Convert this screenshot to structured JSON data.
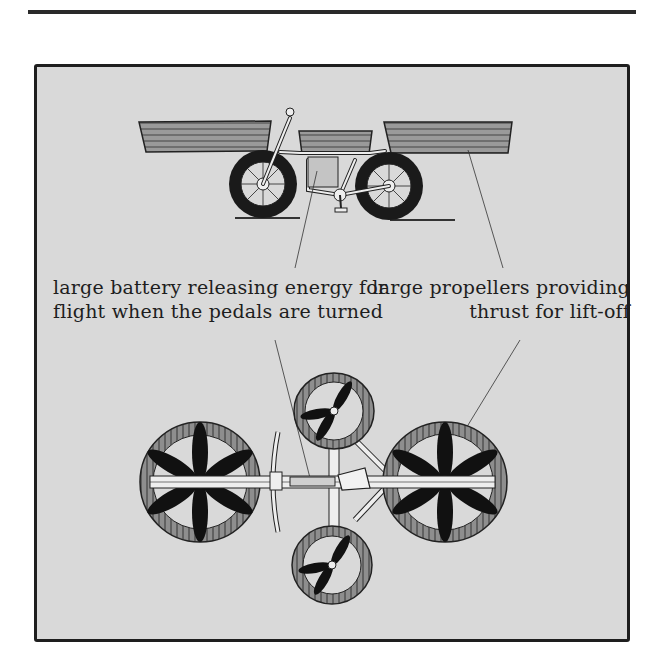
{
  "figure": {
    "panel_background": "#d9d9d9",
    "border_color": "#1e1e1e",
    "side_view": {
      "description": "flying bicycle side view with three propeller housings"
    },
    "top_view": {
      "description": "flying bicycle top view with four propeller rotors"
    },
    "labels": {
      "battery": {
        "line1": "large battery releasing energy for",
        "line2": "flight when the pedals are turned"
      },
      "propellers": {
        "line1": "large propellers providing",
        "line2": "thrust for lift-off"
      }
    }
  }
}
